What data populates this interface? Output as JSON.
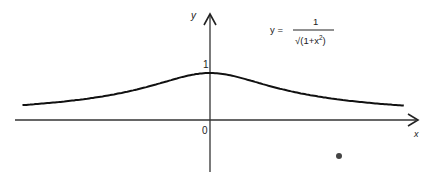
{
  "diagram": {
    "y_axis_label": "y",
    "x_axis_label": "x",
    "origin_label": "0",
    "peak_label": "1",
    "equation": {
      "lhs": "y =",
      "numerator": "1",
      "denominator": "√(1+x²)",
      "denominator_base": "√(1+x",
      "denominator_exp": "2",
      "denominator_close": ")"
    },
    "curve": {
      "function": "y = 1/sqrt(1+x^2)",
      "x_range": [
        -3,
        3.1
      ],
      "peak": [
        0,
        1
      ]
    },
    "colors": {
      "ink": "#222222",
      "background": "#ffffff"
    }
  }
}
